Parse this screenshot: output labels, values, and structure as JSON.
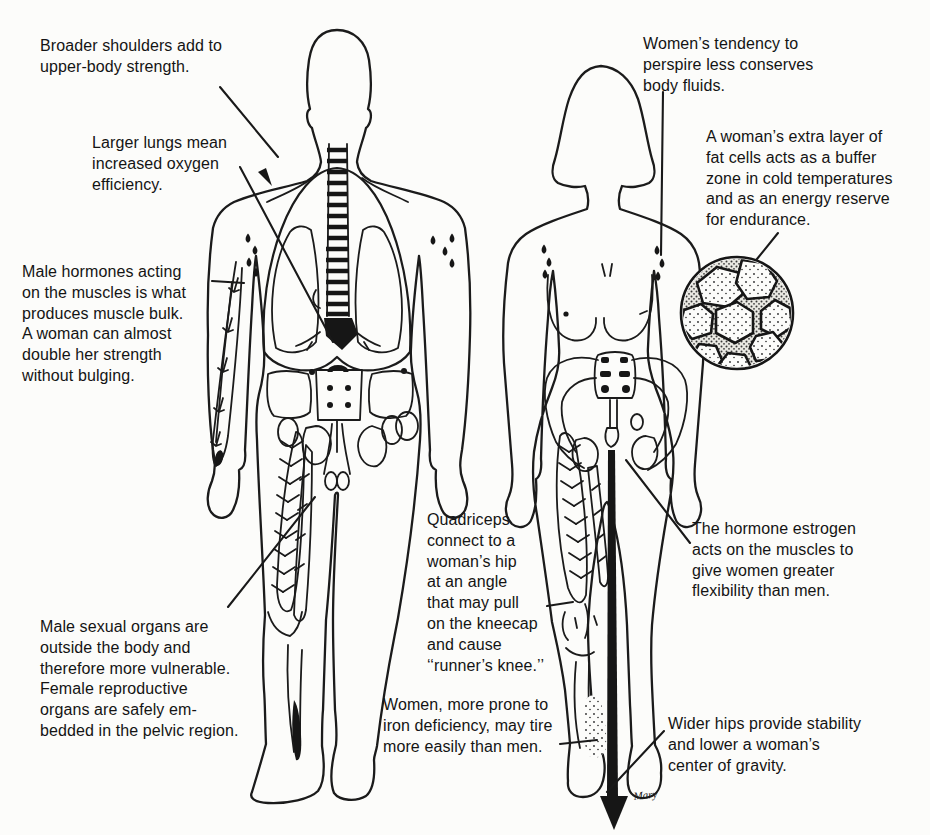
{
  "diagram_title": "Physiological differences between men and women (annotated anatomical line drawing)",
  "colors": {
    "ink": "#1b1b1b",
    "paper": "#fcfcfa"
  },
  "annotations": {
    "broader_shoulders": "Broader shoulders add to\nupper-body strength.",
    "larger_lungs": "Larger lungs mean\nincreased oxygen\nefficiency.",
    "male_hormones": "Male hormones acting\non the muscles is what\nproduces muscle bulk.\nA woman can almost\ndouble her strength\nwithout bulging.",
    "male_sexual_organs": "Male sexual organs are\noutside the body and\ntherefore more vulnerable.\nFemale reproductive\norgans are safely em-\nbedded in the pelvic region.",
    "quadriceps": "Quadriceps\nconnect to a\nwoman’s hip\nat an angle\nthat may pull\non the kneecap\nand cause\n‘‘runner’s knee.’’",
    "iron_deficiency": "Women, more prone to\niron deficiency, may tire\nmore easily than men.",
    "perspire": "Women’s tendency to\nperspire less conserves\nbody fluids.",
    "fat_cells": "A woman’s extra layer of\nfat cells acts as a buffer\nzone in cold temperatures\nand as an energy reserve\nfor endurance.",
    "estrogen": "The hormone estrogen\nacts on the muscles to\ngive women greater\nflexibility than men.",
    "wider_hips": "Wider hips provide stability\nand lower a woman’s\ncenter of gravity."
  },
  "signature": "Mary"
}
